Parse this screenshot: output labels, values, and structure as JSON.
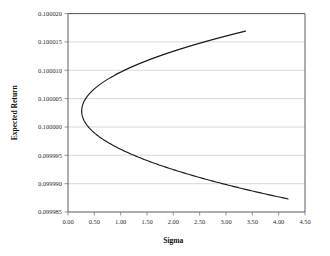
{
  "chart_data": {
    "type": "line",
    "title": "",
    "xlabel": "Sigma",
    "ylabel": "Expected Return",
    "xlim": [
      0.0,
      4.5
    ],
    "ylim": [
      0.099985,
      0.10002
    ],
    "grid": "horizontal",
    "legend": "none",
    "xticks": [
      "0.00",
      "0.50",
      "1.00",
      "1.50",
      "2.00",
      "2.50",
      "3.00",
      "3.50",
      "4.00",
      "4.50"
    ],
    "xtick_values": [
      0.0,
      0.5,
      1.0,
      1.5,
      2.0,
      2.5,
      3.0,
      3.5,
      4.0,
      4.5
    ],
    "yticks": [
      "0.099985",
      "0.099990",
      "0.099995",
      "0.100000",
      "0.100005",
      "0.100010",
      "0.100015",
      "0.100020"
    ],
    "ytick_values": [
      0.099985,
      0.09999,
      0.099995,
      0.1,
      0.100005,
      0.10001,
      0.100015,
      0.10002
    ],
    "series": [
      {
        "name": "frontier",
        "color": "#1c1c1c",
        "x": [
          0.5,
          0.39,
          0.31,
          0.27,
          0.26,
          0.28,
          0.33,
          0.41,
          0.52,
          0.66,
          0.83,
          1.02,
          1.23,
          1.46,
          1.7,
          1.95,
          2.21,
          2.48,
          2.75,
          3.02,
          3.3,
          3.37,
          0.57,
          0.7,
          0.86,
          1.05,
          1.27,
          1.51,
          1.77,
          2.04,
          2.32,
          2.61,
          2.9,
          3.2,
          3.5,
          3.8,
          4.1,
          4.18
        ],
        "y": [
          0.1000042,
          0.100004,
          0.1000037,
          0.1000033,
          0.1000028,
          0.1000023,
          0.1000018,
          0.1000013,
          0.0999921,
          0.0999921,
          0.0999921,
          0.0999921,
          0.0999921,
          0.0999921,
          0.0999921,
          0.0999921,
          0.0999921,
          0.0999921,
          0.0999921,
          0.0999921,
          0.0999921,
          0.0999921,
          0.100005,
          0.1000057,
          0.1000065,
          0.1000074,
          0.1000083,
          0.1000092,
          0.1000101,
          0.100011,
          0.1000119,
          0.1000128,
          0.1000137,
          0.1000146,
          0.1000155,
          0.1000163,
          0.1000169,
          0.100017
        ],
        "vertex": {
          "x": 0.26,
          "y": 0.1000028
        },
        "upper_endpoint": {
          "x": 3.37,
          "y": 0.1000169
        },
        "lower_endpoint": {
          "x": 4.18,
          "y": 0.0999873
        }
      }
    ]
  },
  "axes": {
    "y_title": "Expected Return",
    "x_title": "Sigma"
  }
}
